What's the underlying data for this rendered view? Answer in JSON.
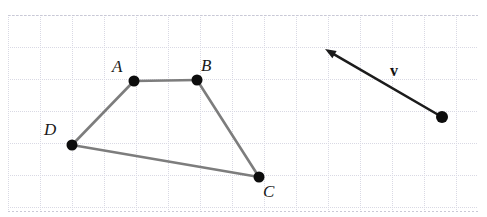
{
  "figure": {
    "background_color": "#ffffff",
    "grid": {
      "x": 8,
      "y": 15,
      "width": 470,
      "height": 196,
      "cell_size": 32,
      "minor_color": "#d9d9e4",
      "major_color": "#c9c9d6",
      "visible": true
    },
    "polygon": {
      "stroke_color": "#7d7d7d",
      "stroke_width": 2.6,
      "vertex_color": "#0d0d0d",
      "vertex_radius": 5.5,
      "closed": false,
      "vertices": [
        {
          "name": "A",
          "label": "A",
          "x": 134,
          "y": 81,
          "label_x": 112,
          "label_y": 58
        },
        {
          "name": "B",
          "label": "B",
          "x": 197,
          "y": 80,
          "label_x": 201,
          "label_y": 57
        },
        {
          "name": "C",
          "label": "C",
          "x": 259,
          "y": 177,
          "label_x": 263,
          "label_y": 183
        },
        {
          "name": "D",
          "label": "D",
          "x": 72,
          "y": 145,
          "label_x": 44,
          "label_y": 121
        }
      ],
      "edges": [
        {
          "from": "D",
          "to": "A"
        },
        {
          "from": "A",
          "to": "B"
        },
        {
          "from": "B",
          "to": "C"
        },
        {
          "from": "C",
          "to": "D"
        }
      ]
    },
    "vector": {
      "label": "v",
      "label_x": 390,
      "label_y": 63,
      "stroke_color": "#1c1c1c",
      "stroke_width": 2.6,
      "tail_x": 442,
      "tail_y": 117,
      "head_x": 325,
      "head_y": 49,
      "tail_dot_color": "#0d0d0d",
      "tail_dot_radius": 6,
      "arrowhead": "filled-triangle"
    }
  }
}
